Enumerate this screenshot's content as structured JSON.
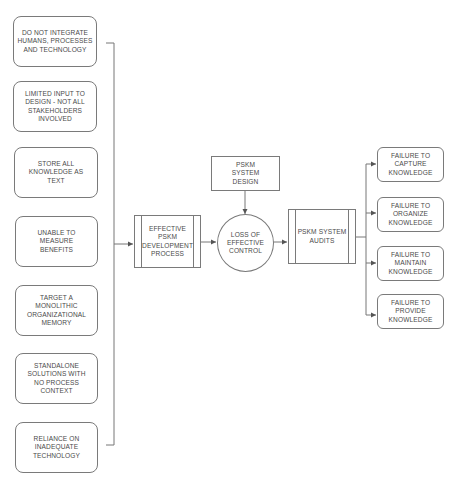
{
  "causes": [
    {
      "label": "DO NOT INTEGRATE HUMANS, PROCESSES AND TECHNOLOGY"
    },
    {
      "label": "LIMITED INPUT TO DESIGN - NOT ALL STAKEHOLDERS INVOLVED"
    },
    {
      "label": "STORE ALL KNOWLEDGE AS TEXT"
    },
    {
      "label": "UNABLE TO MEASURE BENEFITS"
    },
    {
      "label": "TARGET A MONOLITHIC ORGANIZATIONAL MEMORY"
    },
    {
      "label": "STANDALONE SOLUTIONS WITH NO PROCESS CONTEXT"
    },
    {
      "label": "RELIANCE ON INADEQUATE TECHNOLOGY"
    }
  ],
  "process": {
    "development": "EFFECTIVE PSKM DEVELOPMENT PROCESS",
    "design": "PSKM SYSTEM DESIGN",
    "control": "LOSS OF EFFECTIVE CONTROL",
    "audits": "PSKM SYSTEM AUDITS"
  },
  "failures": [
    {
      "label": "FAILURE TO CAPTURE KNOWLEDGE"
    },
    {
      "label": "FAILURE TO ORGANIZE KNOWLEDGE"
    },
    {
      "label": "FAILURE TO MAINTAIN KNOWLEDGE"
    },
    {
      "label": "FAILURE TO PROVIDE KNOWLEDGE"
    }
  ],
  "colors": {
    "stroke": "#7a7a7a",
    "text": "#4a4a4a",
    "background": "#ffffff"
  }
}
